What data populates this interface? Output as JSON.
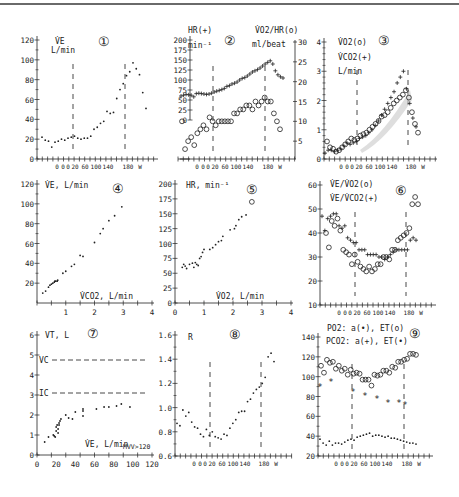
{
  "figure": {
    "phase_axis_labels": [
      "0",
      "0",
      "0",
      "20",
      "60",
      "100",
      "140",
      "180",
      "W"
    ],
    "colors": {
      "ink": "#222222",
      "dash": "#333333",
      "topline": "#6a6a6a",
      "shade": "#c8c8c8"
    }
  },
  "chart_data": [
    {
      "id": 1,
      "type": "scatter",
      "panel_label": "①",
      "ylabel": "V̇E L/min",
      "xlabel": "0 0 0 20 60 100 140 180 W",
      "yticks": [
        0,
        20,
        40,
        60,
        80,
        100,
        120
      ],
      "ylim": [
        0,
        120
      ],
      "threshold_lines": [
        "20 W",
        "180 W"
      ],
      "series": [
        {
          "name": "VE",
          "marker": "dot",
          "values": [
            22,
            19,
            18,
            12,
            17,
            18,
            20,
            19,
            21,
            22,
            23,
            21,
            20,
            21,
            21,
            23,
            30,
            32,
            36,
            38,
            48,
            46,
            47,
            61,
            70,
            76,
            84,
            88,
            97,
            91,
            85,
            67,
            51
          ]
        }
      ]
    },
    {
      "id": 2,
      "type": "scatter",
      "panel_label": "②",
      "ylabel_left": "HR(+) min⁻¹",
      "ylabel_right": "V̇O2/HR(o) ml/beat",
      "yticks_left": [
        0,
        25,
        50,
        75,
        100,
        125,
        150,
        175,
        200
      ],
      "ylim_left": [
        0,
        200
      ],
      "yticks_right": [
        5,
        10,
        15,
        20,
        25,
        30
      ],
      "ylim_right": [
        0,
        30
      ],
      "series": [
        {
          "name": "HR",
          "marker": "+",
          "axis": "left",
          "values": [
            60,
            62,
            64,
            63,
            62,
            58,
            66,
            67,
            66,
            65,
            64,
            65,
            67,
            70,
            72,
            74,
            76,
            79,
            84,
            86,
            90,
            92,
            95,
            100,
            104,
            106,
            110,
            115,
            120,
            123,
            126,
            130,
            135,
            140,
            144,
            148,
            140,
            123,
            113,
            108,
            105
          ]
        },
        {
          "name": "VO2/HR",
          "marker": "o",
          "axis": "right",
          "values": [
            10,
            3,
            5,
            6,
            4,
            7,
            8,
            9,
            8,
            11,
            10,
            9,
            10,
            10,
            10,
            10,
            10,
            12,
            12,
            13,
            13,
            14,
            14,
            13,
            15,
            14,
            15,
            16,
            15,
            15,
            12,
            10,
            8
          ]
        }
      ]
    },
    {
      "id": 3,
      "type": "scatter",
      "panel_label": "③",
      "ylabel": "V̇O2(o) V̇CO2(+) L/min",
      "yticks": [
        0,
        1,
        2,
        3,
        4
      ],
      "ylim": [
        0,
        4
      ],
      "series": [
        {
          "name": "VO2",
          "marker": "o",
          "values": [
            0.6,
            0.4,
            0.35,
            0.25,
            0.3,
            0.4,
            0.5,
            0.6,
            0.7,
            0.65,
            0.7,
            0.8,
            0.85,
            0.9,
            1.0,
            1.1,
            1.2,
            1.3,
            1.45,
            1.5,
            1.6,
            1.75,
            1.9,
            2.0,
            2.1,
            2.2,
            2.35,
            2.1,
            1.6,
            1.2,
            0.9
          ]
        },
        {
          "name": "VCO2",
          "marker": "+",
          "values": [
            0.2,
            0.3,
            0.3,
            0.25,
            0.3,
            0.35,
            0.45,
            0.55,
            0.5,
            0.55,
            0.6,
            0.7,
            0.75,
            0.8,
            0.9,
            1.0,
            1.15,
            1.3,
            1.5,
            1.7,
            1.9,
            2.1,
            2.3,
            2.6,
            2.8,
            3.0,
            2.4,
            1.9,
            1.4,
            1.1
          ]
        }
      ]
    },
    {
      "id": 4,
      "type": "scatter",
      "panel_label": "④",
      "ylabel": "V̇E, L/min",
      "xlabel": "V̇CO2, L/min",
      "xticks": [
        1,
        2,
        3,
        4
      ],
      "xlim": [
        0,
        4
      ],
      "yticks": [
        20,
        40,
        60,
        80,
        100,
        120
      ],
      "ylim": [
        0,
        120
      ],
      "series": [
        {
          "name": "VE vs VCO2",
          "marker": "dot",
          "x": [
            0.2,
            0.3,
            0.4,
            0.45,
            0.5,
            0.55,
            0.6,
            0.62,
            0.65,
            0.7,
            0.72,
            0.9,
            1.0,
            1.2,
            1.3,
            1.5,
            1.6,
            2.0,
            2.2,
            2.3,
            2.5,
            2.7,
            2.95
          ],
          "y": [
            10,
            12,
            16,
            18,
            19,
            20,
            21,
            22,
            22,
            22,
            23,
            30,
            32,
            37,
            39,
            48,
            47,
            61,
            70,
            75,
            83,
            88,
            97
          ]
        }
      ]
    },
    {
      "id": 5,
      "type": "scatter",
      "panel_label": "⑤",
      "ylabel": "HR, min⁻¹",
      "xlabel": "V̇O2, L/min",
      "xticks": [
        0,
        1,
        2,
        3,
        4
      ],
      "xlim": [
        0,
        4
      ],
      "yticks": [
        0,
        25,
        50,
        75,
        100,
        125,
        150,
        175,
        200
      ],
      "ylim": [
        0,
        200
      ],
      "series": [
        {
          "name": "HR vs VO2",
          "marker": "dot",
          "x": [
            0.25,
            0.3,
            0.35,
            0.4,
            0.5,
            0.6,
            0.65,
            0.7,
            0.75,
            0.8,
            0.85,
            0.9,
            0.95,
            1.0,
            1.2,
            1.3,
            1.4,
            1.5,
            1.6,
            1.65,
            1.9,
            2.05,
            2.1,
            2.2,
            2.3,
            2.45
          ],
          "y": [
            60,
            65,
            62,
            58,
            65,
            67,
            60,
            68,
            65,
            63,
            75,
            78,
            85,
            90,
            90,
            93,
            98,
            103,
            105,
            112,
            123,
            125,
            130,
            140,
            145,
            148
          ]
        },
        {
          "name": "peak",
          "marker": "o",
          "x": [
            2.65
          ],
          "y": [
            170
          ]
        }
      ]
    },
    {
      "id": 6,
      "type": "scatter",
      "panel_label": "⑥",
      "ylabel": "V̇E/V̇O2(o) V̇E/V̇CO2(+)",
      "yticks": [
        10,
        20,
        30,
        40,
        50,
        60
      ],
      "ylim": [
        10,
        60
      ],
      "series": [
        {
          "name": "VE/VO2",
          "marker": "o",
          "values": [
            40,
            34,
            45,
            43,
            46,
            41,
            33,
            32,
            31,
            27,
            31,
            28,
            26,
            25,
            24,
            26,
            24,
            25,
            27,
            27,
            30,
            30,
            29,
            33,
            33,
            37,
            38,
            39,
            40,
            42,
            52,
            55,
            52
          ]
        },
        {
          "name": "VE/VCO2",
          "marker": "+",
          "values": [
            47,
            41,
            46,
            47,
            48,
            48,
            43,
            42,
            43,
            38,
            37,
            36,
            36,
            33,
            33,
            33,
            31,
            31,
            31,
            31,
            30,
            30,
            29,
            30,
            31,
            32,
            33,
            33,
            33,
            33,
            33,
            37,
            38,
            37
          ]
        }
      ]
    },
    {
      "id": 7,
      "type": "scatter",
      "panel_label": "⑦",
      "ylabel": "VT, L",
      "xlabel": "V̇E, L/min",
      "annotation": "MVV>120",
      "xticks": [
        0,
        20,
        40,
        60,
        80,
        100,
        120
      ],
      "xlim": [
        0,
        120
      ],
      "yticks": [
        0,
        1,
        2,
        3,
        4,
        5,
        6
      ],
      "ylim": [
        0,
        6
      ],
      "reference_lines": [
        {
          "label": "VC",
          "y": 4.75
        },
        {
          "label": "IC",
          "y": 3.1
        }
      ],
      "series": [
        {
          "name": "VT vs VE",
          "marker": "dot",
          "x": [
            8,
            12,
            17,
            18,
            19,
            20,
            20,
            21,
            22,
            22,
            23,
            23,
            24,
            25,
            30,
            33,
            37,
            40,
            48,
            48,
            48,
            62,
            70,
            75,
            83,
            88,
            97
          ],
          "y": [
            0.65,
            0.9,
            1.0,
            0.95,
            0.9,
            1.2,
            1.4,
            1.5,
            1.1,
            1.3,
            1.6,
            1.5,
            1.7,
            1.8,
            2.0,
            1.85,
            1.8,
            2.15,
            2.3,
            2.2,
            1.95,
            2.3,
            2.4,
            2.4,
            2.45,
            2.55,
            2.4
          ]
        }
      ]
    },
    {
      "id": 8,
      "type": "scatter",
      "panel_label": "⑧",
      "ylabel": "R",
      "yticks": [
        0.6,
        0.8,
        1.0,
        1.2,
        1.4,
        1.6
      ],
      "ylim": [
        0.6,
        1.6
      ],
      "threshold_lines": [
        "20 W",
        "180 W"
      ],
      "series": [
        {
          "name": "R",
          "marker": "dot",
          "values": [
            0.87,
            0.85,
            0.98,
            0.93,
            0.96,
            0.88,
            0.84,
            0.83,
            0.78,
            0.76,
            0.82,
            0.77,
            0.8,
            0.76,
            0.75,
            0.74,
            0.78,
            0.77,
            0.83,
            0.87,
            0.9,
            0.96,
            0.97,
            0.97,
            1.05,
            1.07,
            1.12,
            1.15,
            1.17,
            1.2,
            1.25,
            1.42,
            1.45,
            1.38
          ]
        }
      ]
    },
    {
      "id": 9,
      "type": "scatter",
      "panel_label": "⑨",
      "ylabel": "PO2: a(•), ET(o) PCO2: a(+), ET(•)",
      "yticks": [
        20,
        40,
        60,
        80,
        100,
        120,
        140
      ],
      "ylim": [
        20,
        140
      ],
      "series": [
        {
          "name": "PO2 ET",
          "marker": "o",
          "values": [
            111,
            104,
            117,
            114,
            115,
            108,
            111,
            106,
            108,
            102,
            107,
            103,
            104,
            103,
            97,
            97,
            97,
            91,
            102,
            101,
            102,
            106,
            106,
            104,
            110,
            109,
            115,
            115,
            117,
            118,
            123,
            123,
            122
          ]
        },
        {
          "name": "PO2 a",
          "marker": "*",
          "values": [
            90,
            95,
            85,
            81,
            77,
            73,
            73,
            71
          ]
        },
        {
          "name": "PCO2 ET/a",
          "marker": "dot",
          "values": [
            37,
            33,
            31,
            35,
            31,
            33,
            33,
            32,
            34,
            36,
            37,
            36,
            39,
            40,
            41,
            42,
            43,
            40,
            41,
            41,
            40,
            39,
            40,
            38,
            38,
            37,
            36,
            35,
            34,
            33,
            33,
            32
          ]
        }
      ]
    }
  ]
}
